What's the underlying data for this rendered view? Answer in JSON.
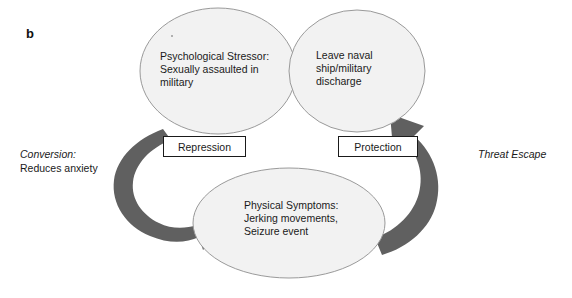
{
  "figure": {
    "panel_letter": "b",
    "background_color": "#ffffff",
    "ellipse_fill": "#f2f2f2",
    "ellipse_stroke": "#9a9a9a",
    "arrow_color": "#606060",
    "text_color": "#1a1a1a"
  },
  "nodes": [
    {
      "id": "psychological-stressor",
      "text": "Psychological Stressor:\nSexually assaulted in\nmilitary"
    },
    {
      "id": "leave-naval-ship",
      "text": "Leave naval\nship/military\ndischarge"
    },
    {
      "id": "physical-symptoms",
      "text": "Physical Symptoms:\nJerking movements,\nSeizure event"
    }
  ],
  "boxes": [
    {
      "id": "repression",
      "label": "Repression"
    },
    {
      "id": "protection",
      "label": "Protection"
    }
  ],
  "side_labels": {
    "left": {
      "line1": "Conversion:",
      "line2": "Reduces anxiety"
    },
    "right": {
      "line1": "Threat Escape"
    }
  },
  "arrows": [
    {
      "id": "conversion-arrow",
      "from": "psychological-stressor",
      "to": "physical-symptoms",
      "label": "Conversion: Reduces anxiety"
    },
    {
      "id": "threat-escape-arrow",
      "from": "physical-symptoms",
      "to": "leave-naval-ship",
      "label": "Threat Escape"
    }
  ]
}
